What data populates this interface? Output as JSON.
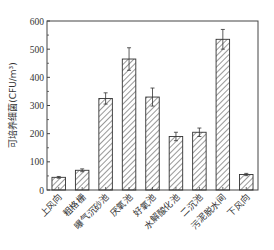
{
  "chart_data": {
    "type": "bar",
    "title": "",
    "xlabel": "",
    "ylabel": "可培养细菌(CFU/m³)",
    "ylim": [
      0,
      600
    ],
    "yticks": [
      0,
      100,
      200,
      300,
      400,
      500,
      600
    ],
    "categories": [
      "上风向",
      "粗格栅",
      "曝气沉砂池",
      "厌氧池",
      "好氧池",
      "水解酸化池",
      "二沉池",
      "污泥脱水间",
      "下风向"
    ],
    "values": [
      45,
      70,
      325,
      465,
      330,
      190,
      205,
      535,
      55
    ],
    "errors": [
      3,
      5,
      20,
      40,
      32,
      15,
      15,
      35,
      4
    ],
    "grid": false,
    "legend": null,
    "bar_fill": "hatched diagonal",
    "colors": {
      "axis": "#444444",
      "bar_edge": "#333333",
      "hatch": "#333333"
    }
  }
}
